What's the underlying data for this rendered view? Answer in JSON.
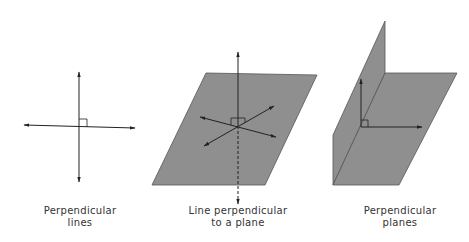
{
  "figures": [
    {
      "id": "perpendicular-lines",
      "caption_line1": "Perpendicular",
      "caption_line2": "lines"
    },
    {
      "id": "line-perpendicular-to-plane",
      "caption_line1": "Line perpendicular",
      "caption_line2": "to a plane"
    },
    {
      "id": "perpendicular-planes",
      "caption_line1": "Perpendicular",
      "caption_line2": "planes"
    }
  ],
  "colors": {
    "plane_fill": "#8f8f8f",
    "plane_stroke": "#555555",
    "line": "#222222"
  }
}
